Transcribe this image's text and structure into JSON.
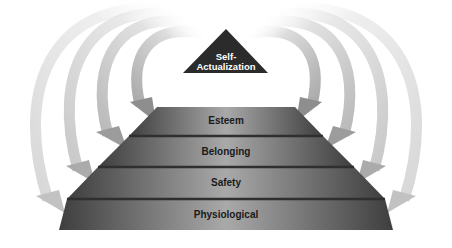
{
  "diagram": {
    "apex": {
      "line1": "Self-",
      "line2": "Actualization"
    },
    "levels": [
      {
        "label": "Esteem"
      },
      {
        "label": "Belonging"
      },
      {
        "label": "Safety"
      },
      {
        "label": "Physiological"
      }
    ],
    "arrows": {
      "left_count": 4,
      "right_count": 4,
      "direction": "from apex down to each level"
    },
    "colors": {
      "apex": "#2b2b2b",
      "level_dark": "#4a4a4a",
      "level_light": "#a8a8a8",
      "separator": "#333333",
      "arrow_light": "#dcdcdc",
      "arrow_dark": "#8c8c8c"
    }
  }
}
